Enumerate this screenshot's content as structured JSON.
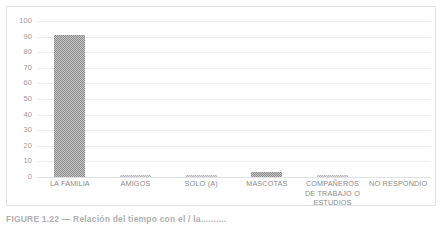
{
  "chart_data": {
    "type": "bar",
    "title": "",
    "xlabel": "",
    "ylabel": "",
    "ylim": [
      0,
      100
    ],
    "ytick_step": 10,
    "grid": true,
    "legend": false,
    "bar_style": "textured-gray",
    "categories": [
      "LA FAMILIA",
      "AMIGOS",
      "SOLO (A)",
      "MASCOTAS",
      "COMPAÑEROS DE TRABAJO O ESTUDIOS",
      "NO RESPONDIO"
    ],
    "values": [
      91,
      1,
      1,
      3,
      1,
      0
    ],
    "yticks": [
      0,
      10,
      20,
      30,
      40,
      50,
      60,
      70,
      80,
      90,
      100
    ],
    "colors": {
      "bar_fill": "#969696",
      "bar_fill_light": "#c4c4c4",
      "gridline": "#eceff1",
      "axis_text": "#9a9a9a",
      "category_text": "#8c8c8c",
      "frame_border": "#e3e3e3",
      "background": "#ffffff"
    }
  },
  "caption": {
    "text": "FIGURE 1.22 — Relación del tiempo con el / la.........."
  }
}
